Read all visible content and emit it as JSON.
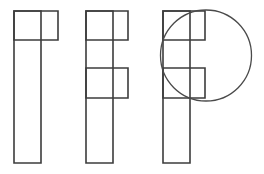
{
  "canvas": {
    "width": 264,
    "height": 174,
    "background_color": "#ffffff",
    "stroke_color": "#3c3c3c",
    "stroke_width": 1.6
  },
  "figures": [
    {
      "name": "figure-one-bar-with-top-square",
      "description": "Tall vertical rectangle with a square attached at its top right",
      "rects": [
        {
          "name": "vertical-bar",
          "x": 14,
          "y": 11,
          "w": 27,
          "h": 152
        },
        {
          "name": "top-arm",
          "x": 14,
          "y": 11,
          "w": 44,
          "h": 29
        }
      ]
    },
    {
      "name": "figure-two-f-shape",
      "description": "Tall vertical rectangle with a top arm and a middle arm forming an F",
      "rects": [
        {
          "name": "vertical-bar",
          "x": 86,
          "y": 11,
          "w": 27,
          "h": 152
        },
        {
          "name": "top-arm",
          "x": 86,
          "y": 11,
          "w": 42,
          "h": 29
        },
        {
          "name": "middle-arm",
          "x": 86,
          "y": 68,
          "w": 42,
          "h": 30
        }
      ]
    },
    {
      "name": "figure-three-f-shape-with-circle",
      "description": "F shape overlaid by a large circle centred on the upper arms",
      "rects": [
        {
          "name": "vertical-bar",
          "x": 163,
          "y": 11,
          "w": 27,
          "h": 152
        },
        {
          "name": "top-arm",
          "x": 163,
          "y": 11,
          "w": 42,
          "h": 29
        },
        {
          "name": "middle-arm",
          "x": 163,
          "y": 68,
          "w": 42,
          "h": 30
        }
      ],
      "circles": [
        {
          "name": "overlay-circle",
          "cx": 206,
          "cy": 55.5,
          "r": 45.5
        }
      ]
    }
  ]
}
